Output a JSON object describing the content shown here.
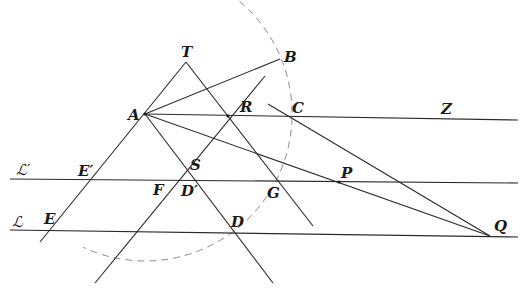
{
  "diagram": {
    "title": "",
    "arc": {
      "name": "construction-circle-arc",
      "cx": 145,
      "cy": 114,
      "r": 147,
      "startDeg": -125,
      "endDeg": 115,
      "style": "dashed",
      "color": "#8a8a8a"
    },
    "lines": [
      {
        "name": "line-T-A-E",
        "x1": 186,
        "y1": 62,
        "x2": 40,
        "y2": 242
      },
      {
        "name": "line-T-R-G",
        "x1": 186,
        "y1": 62,
        "x2": 313,
        "y2": 226
      },
      {
        "name": "line-A-S-D",
        "x1": 145,
        "y1": 114,
        "x2": 273,
        "y2": 283
      },
      {
        "name": "line-R-F-parallel",
        "x1": 265,
        "y1": 76,
        "x2": 95,
        "y2": 283
      },
      {
        "name": "line-A-B",
        "x1": 145,
        "y1": 114,
        "x2": 280,
        "y2": 59
      },
      {
        "name": "line-A-C-Z",
        "x1": 145,
        "y1": 114,
        "x2": 518,
        "y2": 120
      },
      {
        "name": "line-A-P-Q",
        "x1": 145,
        "y1": 114,
        "x2": 490,
        "y2": 236
      },
      {
        "name": "line-C-Q",
        "x1": 268,
        "y1": 104,
        "x2": 490,
        "y2": 236
      },
      {
        "name": "line-L-prime",
        "x1": 10,
        "y1": 179,
        "x2": 518,
        "y2": 183
      },
      {
        "name": "line-L",
        "x1": 10,
        "y1": 230,
        "x2": 518,
        "y2": 237
      }
    ],
    "labels": [
      {
        "name": "label-T",
        "text": "T",
        "x": 181,
        "y": 57,
        "cls": "lbl"
      },
      {
        "name": "label-B",
        "text": "B",
        "x": 284,
        "y": 62,
        "cls": "lbl"
      },
      {
        "name": "label-A",
        "text": "A",
        "x": 128,
        "y": 120,
        "cls": "lbl"
      },
      {
        "name": "label-R",
        "text": "R",
        "x": 240,
        "y": 112,
        "cls": "lbl"
      },
      {
        "name": "label-C",
        "text": "C",
        "x": 292,
        "y": 113,
        "cls": "lbl"
      },
      {
        "name": "label-Z",
        "text": "Z",
        "x": 441,
        "y": 114,
        "cls": "lbl"
      },
      {
        "name": "label-L-prime",
        "text": "ℒ′",
        "x": 16,
        "y": 175,
        "cls": "script"
      },
      {
        "name": "label-E-prime",
        "text": "E′",
        "x": 78,
        "y": 176,
        "cls": "lbl"
      },
      {
        "name": "label-S",
        "text": "S",
        "x": 190,
        "y": 170,
        "cls": "lbl"
      },
      {
        "name": "label-F",
        "text": "F",
        "x": 153,
        "y": 195,
        "cls": "lbl"
      },
      {
        "name": "label-D-prime",
        "text": "D′",
        "x": 181,
        "y": 196,
        "cls": "lbl"
      },
      {
        "name": "label-G",
        "text": "G",
        "x": 267,
        "y": 198,
        "cls": "lbl"
      },
      {
        "name": "label-P",
        "text": "P",
        "x": 341,
        "y": 178,
        "cls": "lbl"
      },
      {
        "name": "label-L",
        "text": "ℒ",
        "x": 12,
        "y": 227,
        "cls": "script"
      },
      {
        "name": "label-E",
        "text": "E",
        "x": 44,
        "y": 224,
        "cls": "lbl"
      },
      {
        "name": "label-D",
        "text": "D",
        "x": 231,
        "y": 227,
        "cls": "lbl"
      },
      {
        "name": "label-Q",
        "text": "Q",
        "x": 494,
        "y": 231,
        "cls": "lbl"
      }
    ],
    "points": [
      {
        "name": "point-A",
        "x": 145,
        "y": 114
      },
      {
        "name": "point-R",
        "x": 228,
        "y": 116
      },
      {
        "name": "point-P",
        "x": 339,
        "y": 182
      }
    ]
  }
}
